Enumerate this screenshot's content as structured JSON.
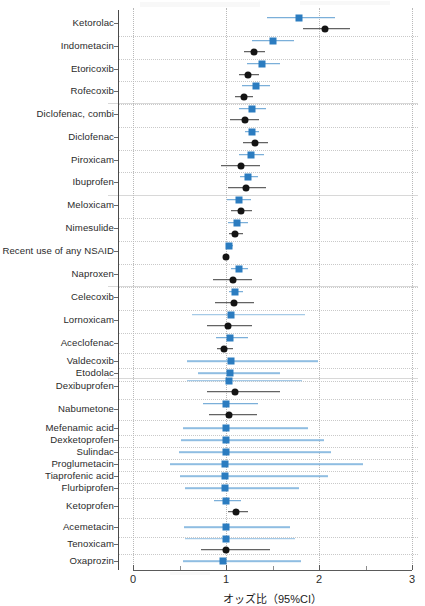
{
  "chart_data": {
    "type": "scatter",
    "title": "",
    "xlabel": "オッズ比（95%CI）",
    "ylabel": "",
    "xlim": [
      0,
      3
    ],
    "xticks": [
      0,
      1,
      2,
      3
    ],
    "xticklabels": [
      "0",
      "1",
      "2",
      "3"
    ],
    "reference_line": 1,
    "grid": true,
    "legend_position": "none",
    "series": [
      {
        "name": "blue",
        "marker": "square",
        "color": "#2b7cc0"
      },
      {
        "name": "dark",
        "marker": "circle",
        "color": "#141414"
      }
    ],
    "categories": [
      "Ketorolac",
      "Indometacin",
      "Etoricoxib",
      "Rofecoxib",
      "Diclofenac, combi",
      "Diclofenac",
      "Piroxicam",
      "Ibuprofen",
      "Meloxicam",
      "Nimesulide",
      "Recent use of any NSAID",
      "Naproxen",
      "Celecoxib",
      "Lornoxicam",
      "Aceclofenac",
      "Valdecoxib",
      "Etodolac",
      "Dexibuprofen",
      "Nabumetone",
      "Mefenamic acid",
      "Dexketoprofen",
      "Sulindac",
      "Proglumetacin",
      "Tiaprofenic acid",
      "Flurbiprofen",
      "Ketoprofen",
      "Acemetacin",
      "Tenoxicam",
      "Oxaprozin"
    ],
    "rows": [
      {
        "label": "Ketorolac",
        "y": 23,
        "blue": {
          "or": 1.78,
          "lo": 1.44,
          "hi": 2.17
        },
        "dark": {
          "or": 2.06,
          "lo": 1.83,
          "hi": 2.33
        }
      },
      {
        "label": "Indometacin",
        "y": 46,
        "blue": {
          "or": 1.51,
          "lo": 1.28,
          "hi": 1.73
        },
        "dark": {
          "or": 1.3,
          "lo": 1.19,
          "hi": 1.42
        }
      },
      {
        "label": "Etoricoxib",
        "y": 69,
        "blue": {
          "or": 1.39,
          "lo": 1.23,
          "hi": 1.58
        },
        "dark": {
          "or": 1.24,
          "lo": 1.14,
          "hi": 1.36
        }
      },
      {
        "label": "Rofecoxib",
        "y": 91,
        "blue": {
          "or": 1.32,
          "lo": 1.17,
          "hi": 1.47
        },
        "dark": {
          "or": 1.19,
          "lo": 1.1,
          "hi": 1.29
        }
      },
      {
        "label": "Diclofenac, combi",
        "y": 114,
        "blue": {
          "or": 1.28,
          "lo": 1.14,
          "hi": 1.43
        },
        "dark": {
          "or": 1.2,
          "lo": 1.04,
          "hi": 1.36
        }
      },
      {
        "label": "Diclofenac",
        "y": 137,
        "blue": {
          "or": 1.28,
          "lo": 1.2,
          "hi": 1.36
        },
        "dark": {
          "or": 1.31,
          "lo": 1.18,
          "hi": 1.45
        }
      },
      {
        "label": "Piroxicam",
        "y": 160,
        "blue": {
          "or": 1.27,
          "lo": 1.14,
          "hi": 1.41
        },
        "dark": {
          "or": 1.16,
          "lo": 0.95,
          "hi": 1.37
        }
      },
      {
        "label": "Ibuprofen",
        "y": 182,
        "blue": {
          "or": 1.24,
          "lo": 1.15,
          "hi": 1.34
        },
        "dark": {
          "or": 1.22,
          "lo": 1.02,
          "hi": 1.43
        }
      },
      {
        "label": "Meloxicam",
        "y": 205,
        "blue": {
          "or": 1.14,
          "lo": 1.01,
          "hi": 1.27
        },
        "dark": {
          "or": 1.16,
          "lo": 1.05,
          "hi": 1.28
        }
      },
      {
        "label": "Nimesulide",
        "y": 228,
        "blue": {
          "or": 1.12,
          "lo": 1.02,
          "hi": 1.24
        },
        "dark": {
          "or": 1.1,
          "lo": 1.03,
          "hi": 1.18
        }
      },
      {
        "label": "Recent use of any NSAID",
        "y": 251,
        "blue": {
          "or": 1.03,
          "lo": 1.0,
          "hi": 1.07
        },
        "dark": {
          "or": 1.0,
          "lo": 0.97,
          "hi": 1.03
        }
      },
      {
        "label": "Naproxen",
        "y": 274,
        "blue": {
          "or": 1.14,
          "lo": 1.05,
          "hi": 1.24
        },
        "dark": {
          "or": 1.07,
          "lo": 0.86,
          "hi": 1.28
        }
      },
      {
        "label": "Celecoxib",
        "y": 297,
        "blue": {
          "or": 1.1,
          "lo": 1.03,
          "hi": 1.18
        },
        "dark": {
          "or": 1.09,
          "lo": 0.88,
          "hi": 1.3
        }
      },
      {
        "label": "Lornoxicam",
        "y": 320,
        "blue": {
          "or": 1.05,
          "lo": 0.63,
          "hi": 1.85
        },
        "dark": {
          "or": 1.02,
          "lo": 0.8,
          "hi": 1.28
        }
      },
      {
        "label": "Aceclofenac",
        "y": 343,
        "blue": {
          "or": 1.04,
          "lo": 0.89,
          "hi": 1.24
        },
        "dark": {
          "or": 0.98,
          "lo": 0.9,
          "hi": 1.08
        }
      },
      {
        "label": "Valdecoxib",
        "y": 361,
        "blue": {
          "or": 1.05,
          "lo": 0.58,
          "hi": 1.99
        },
        "dark": null
      },
      {
        "label": "Etodolac",
        "y": 373,
        "blue": {
          "or": 1.04,
          "lo": 0.7,
          "hi": 1.58
        },
        "dark": null
      },
      {
        "label": "Dexibuprofen",
        "y": 386,
        "blue": {
          "or": 1.03,
          "lo": 0.58,
          "hi": 1.82
        },
        "dark": {
          "or": 1.1,
          "lo": 0.8,
          "hi": 1.58
        }
      },
      {
        "label": "Nabumetone",
        "y": 409,
        "blue": {
          "or": 1.0,
          "lo": 0.75,
          "hi": 1.34
        },
        "dark": {
          "or": 1.03,
          "lo": 0.82,
          "hi": 1.33
        }
      },
      {
        "label": "Mefenamic acid",
        "y": 428,
        "blue": {
          "or": 1.0,
          "lo": 0.54,
          "hi": 1.88
        },
        "dark": null
      },
      {
        "label": "Dexketoprofen",
        "y": 440,
        "blue": {
          "or": 1.0,
          "lo": 0.52,
          "hi": 2.05
        },
        "dark": null
      },
      {
        "label": "Sulindac",
        "y": 452,
        "blue": {
          "or": 1.0,
          "lo": 0.49,
          "hi": 2.13
        },
        "dark": null
      },
      {
        "label": "Proglumetacin",
        "y": 464,
        "blue": {
          "or": 0.99,
          "lo": 0.4,
          "hi": 2.47
        },
        "dark": null
      },
      {
        "label": "Tiaprofenic acid",
        "y": 476,
        "blue": {
          "or": 0.99,
          "lo": 0.51,
          "hi": 2.1
        },
        "dark": null
      },
      {
        "label": "Flurbiprofen",
        "y": 488,
        "blue": {
          "or": 0.99,
          "lo": 0.56,
          "hi": 1.78
        },
        "dark": null
      },
      {
        "label": "Ketoprofen",
        "y": 506,
        "blue": {
          "or": 1.0,
          "lo": 0.87,
          "hi": 1.16
        },
        "dark": {
          "or": 1.11,
          "lo": 1.02,
          "hi": 1.24
        }
      },
      {
        "label": "Acemetacin",
        "y": 527,
        "blue": {
          "or": 1.0,
          "lo": 0.55,
          "hi": 1.69
        },
        "dark": null
      },
      {
        "label": "Tenoxicam",
        "y": 544,
        "blue": {
          "or": 1.0,
          "lo": 0.56,
          "hi": 1.74
        },
        "dark": {
          "or": 1.0,
          "lo": 0.73,
          "hi": 1.47
        }
      },
      {
        "label": "Oxaprozin",
        "y": 561,
        "blue": {
          "or": 0.97,
          "lo": 0.54,
          "hi": 1.81
        },
        "dark": null
      }
    ]
  },
  "axis": {
    "x_title": "オッズ比（95%CI）",
    "ticks": [
      "0",
      "1",
      "2",
      "3"
    ]
  },
  "colors": {
    "blue_marker": "#2b7cc0",
    "blue_ci": "#5b9bd0",
    "blue_ci_pale": "#8fbde2",
    "dark_marker": "#141414",
    "dark_ci": "#3c3c3c",
    "gridline": "#c9c9c9",
    "axis": "#5a5a5a"
  }
}
